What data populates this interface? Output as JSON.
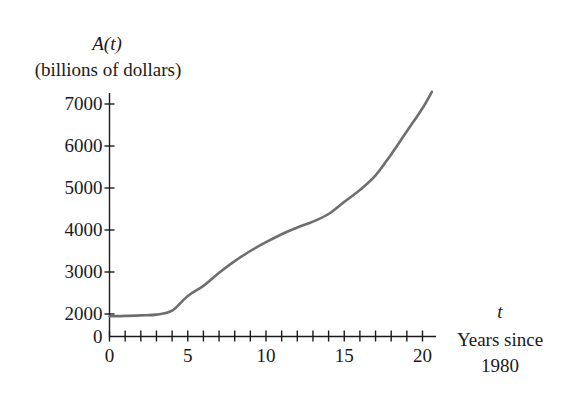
{
  "chart_data": {
    "type": "line",
    "title": "",
    "ylabel_line1": "A(t)",
    "ylabel_line2": "(billions of dollars)",
    "xlabel_var": "t",
    "xlabel_line1": "Years since",
    "xlabel_line2": "1980",
    "x_ticks": [
      0,
      5,
      10,
      15,
      20
    ],
    "x_minor_tick_step": 1,
    "xlim": [
      0,
      20.6
    ],
    "y_ticks": [
      0,
      2000,
      3000,
      4000,
      5000,
      6000,
      7000
    ],
    "y_axis_break": "axis jumps from 0 directly to 2000 (compressed gap)",
    "ylim": [
      0,
      7300
    ],
    "grid": false,
    "legend": null,
    "series": [
      {
        "name": "A(t)",
        "color": "#6e6e6e",
        "x": [
          0,
          1,
          2,
          3,
          4,
          5,
          6,
          7,
          8,
          9,
          10,
          11,
          12,
          13,
          14,
          15,
          16,
          17,
          18,
          19,
          20,
          20.6
        ],
        "values": [
          1800,
          1830,
          1880,
          1950,
          2080,
          2430,
          2670,
          2980,
          3260,
          3500,
          3710,
          3900,
          4060,
          4200,
          4380,
          4670,
          4950,
          5300,
          5800,
          6350,
          6900,
          7290
        ]
      }
    ]
  },
  "labels": {
    "y_title": "A(t)",
    "y_units": "(billions of dollars)",
    "x_var": "t",
    "x_title_1": "Years since",
    "x_title_2": "1980",
    "x_tick_labels": [
      "0",
      "5",
      "10",
      "15",
      "20"
    ],
    "y_tick_labels": [
      "0",
      "2000",
      "3000",
      "4000",
      "5000",
      "6000",
      "7000"
    ]
  }
}
